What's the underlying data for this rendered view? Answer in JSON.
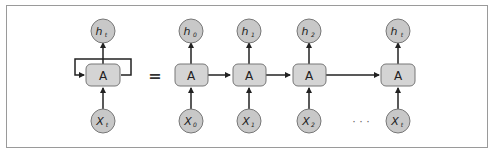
{
  "diagram": {
    "colors": {
      "node_fill": "#c8c8c8",
      "node_stroke": "#777777",
      "cell_fill": "#d4d4d4",
      "cell_stroke": "#777777",
      "arrow": "#222222",
      "frame": "#9a9a9a"
    },
    "rolled": {
      "output": {
        "base": "h",
        "sub": "t"
      },
      "cell": "A",
      "input": {
        "base": "X",
        "sub": "t"
      }
    },
    "equals_sign": "=",
    "ellipsis": "· · ·",
    "unrolled": [
      {
        "output": {
          "base": "h",
          "sub": "0"
        },
        "cell": "A",
        "input": {
          "base": "X",
          "sub": "0"
        }
      },
      {
        "output": {
          "base": "h",
          "sub": "1"
        },
        "cell": "A",
        "input": {
          "base": "X",
          "sub": "1"
        }
      },
      {
        "output": {
          "base": "h",
          "sub": "2"
        },
        "cell": "A",
        "input": {
          "base": "X",
          "sub": "2"
        }
      },
      {
        "output": {
          "base": "h",
          "sub": "t"
        },
        "cell": "A",
        "input": {
          "base": "X",
          "sub": "t"
        }
      }
    ]
  }
}
